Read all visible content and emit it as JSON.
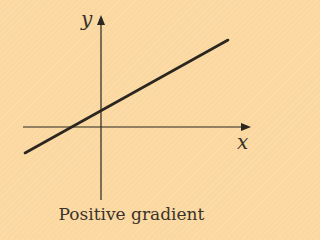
{
  "diagram": {
    "title": "Positive gradient",
    "x_axis_label": "x",
    "y_axis_label": "y",
    "line": {
      "slope_sign": "positive",
      "y_intercept_sign": "positive",
      "x_intercept_sign": "negative"
    },
    "colors": {
      "background": "#FBD8A0",
      "ink": "#2b2620"
    }
  }
}
